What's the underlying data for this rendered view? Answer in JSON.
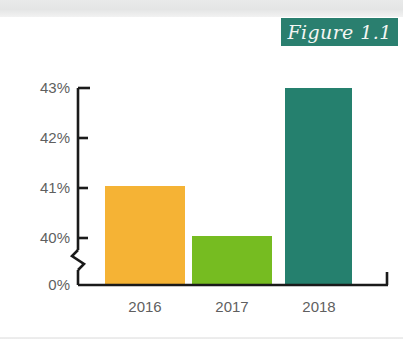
{
  "figure": {
    "badge_label": "Figure 1.1",
    "badge_color": "#2a7f6f",
    "badge_text_color": "#f4f6f3"
  },
  "chart_data": {
    "type": "bar",
    "title": "Figure 1.1",
    "xlabel": "",
    "ylabel": "",
    "categories": [
      "2016",
      "2017",
      "2018"
    ],
    "values": [
      41.05,
      40.05,
      43.0
    ],
    "value_labels": [
      "41%",
      "40%",
      "43%"
    ],
    "colors": [
      "#f5b335",
      "#76bc21",
      "#25806e"
    ],
    "series": [
      {
        "name": "Percentage",
        "values": [
          41.05,
          40.05,
          43.0
        ]
      }
    ],
    "ytick_labels": [
      "43%",
      "42%",
      "41%",
      "40%",
      "0%"
    ],
    "ytick_values": [
      43,
      42,
      41,
      40,
      0
    ],
    "ylim": [
      0,
      43
    ],
    "axis_break": true,
    "axis_break_between": [
      0,
      40
    ],
    "grid": false,
    "legend": false,
    "units": "percent"
  }
}
